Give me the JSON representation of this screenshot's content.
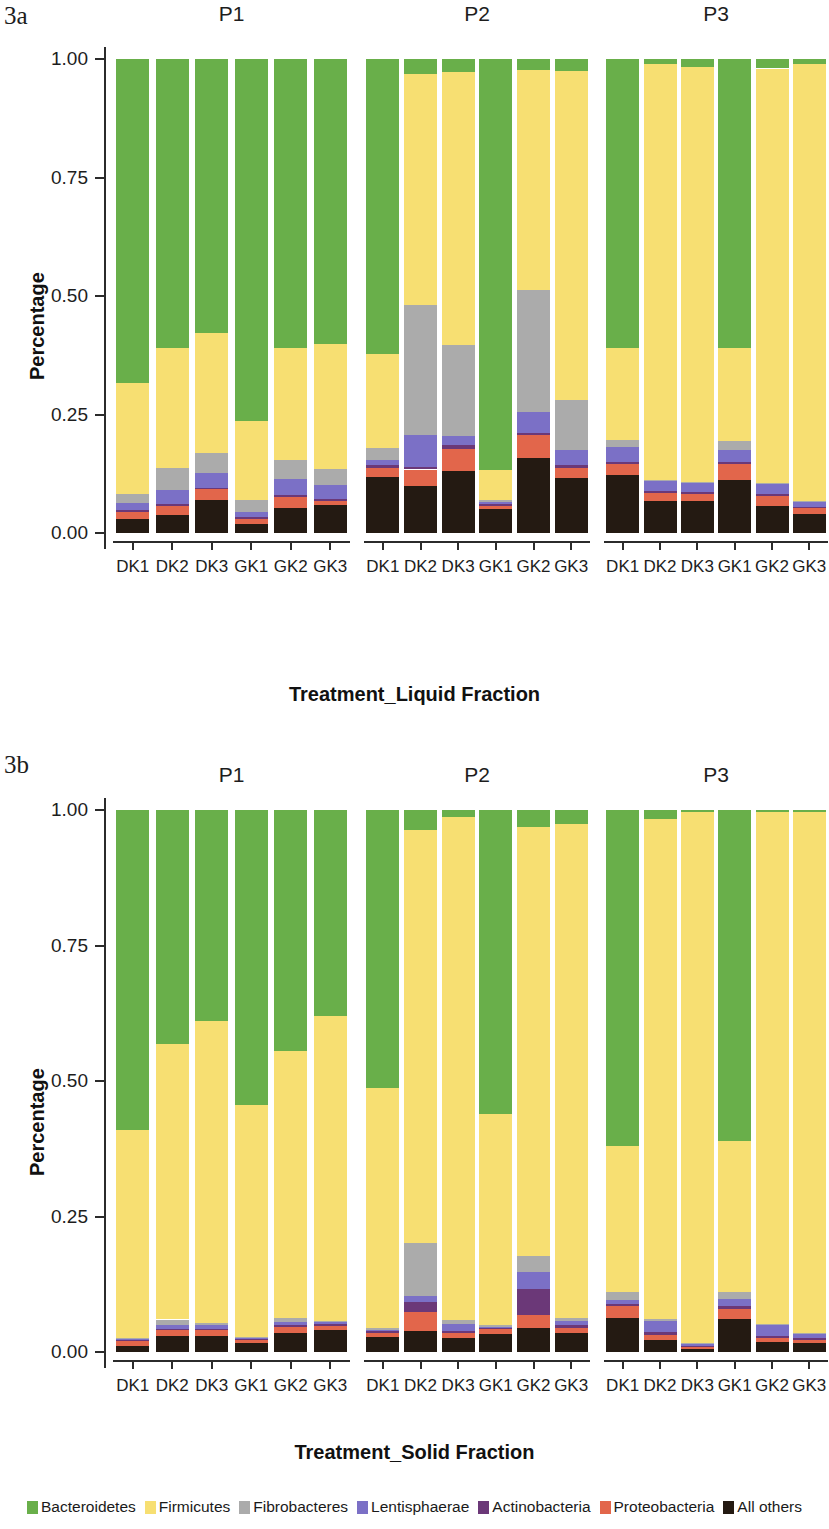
{
  "figure": {
    "panel_a_label": "3a",
    "panel_b_label": "3b"
  },
  "axis": {
    "ylabel": "Percentage",
    "yticks": [
      "0.00",
      "0.25",
      "0.50",
      "0.75",
      "1.00"
    ],
    "ytick_values": [
      0.0,
      0.25,
      0.5,
      0.75,
      1.0
    ],
    "xlabel_a": "Treatment_Liquid Fraction",
    "xlabel_b": "Treatment_Solid Fraction",
    "xticks": [
      "DK1",
      "DK2",
      "DK3",
      "GK1",
      "GK2",
      "GK3"
    ],
    "facets": [
      "P1",
      "P2",
      "P3"
    ]
  },
  "legend": {
    "position": "bottom",
    "items": [
      {
        "label": "Bacteroidetes",
        "color": "#69AF4A"
      },
      {
        "label": "Firmicutes",
        "color": "#F7DF72"
      },
      {
        "label": "Fibrobacteres",
        "color": "#ABABAB"
      },
      {
        "label": "Lentisphaerae",
        "color": "#7B70C6"
      },
      {
        "label": "Actinobacteria",
        "color": "#6B3878"
      },
      {
        "label": "Proteobacteria",
        "color": "#E2664B"
      },
      {
        "label": "All others",
        "color": "#241A12"
      }
    ]
  },
  "chart_data": [
    {
      "id": "3a",
      "type": "bar",
      "stacked": true,
      "title": "3a",
      "xlabel": "Treatment_Liquid Fraction",
      "ylabel": "Percentage",
      "ylim": [
        0,
        1
      ],
      "grid": false,
      "facets": [
        "P1",
        "P2",
        "P3"
      ],
      "categories": [
        "DK1",
        "DK2",
        "DK3",
        "GK1",
        "GK2",
        "GK3"
      ],
      "series_order": [
        "All others",
        "Proteobacteria",
        "Actinobacteria",
        "Lentisphaerae",
        "Fibrobacteres",
        "Firmicutes",
        "Bacteroidetes"
      ],
      "panels": [
        {
          "facet": "P1",
          "bars": [
            {
              "category": "DK1",
              "values": {
                "All others": 0.03,
                "Proteobacteria": 0.014,
                "Actinobacteria": 0.004,
                "Lentisphaerae": 0.016,
                "Fibrobacteres": 0.018,
                "Firmicutes": 0.235,
                "Bacteroidetes": 0.683
              }
            },
            {
              "category": "DK2",
              "values": {
                "All others": 0.038,
                "Proteobacteria": 0.02,
                "Actinobacteria": 0.004,
                "Lentisphaerae": 0.029,
                "Fibrobacteres": 0.046,
                "Firmicutes": 0.253,
                "Bacteroidetes": 0.61
              }
            },
            {
              "category": "DK3",
              "values": {
                "All others": 0.07,
                "Proteobacteria": 0.022,
                "Actinobacteria": 0.004,
                "Lentisphaerae": 0.03,
                "Fibrobacteres": 0.042,
                "Firmicutes": 0.255,
                "Bacteroidetes": 0.577
              }
            },
            {
              "category": "GK1",
              "values": {
                "All others": 0.018,
                "Proteobacteria": 0.012,
                "Actinobacteria": 0.003,
                "Lentisphaerae": 0.012,
                "Fibrobacteres": 0.024,
                "Firmicutes": 0.167,
                "Bacteroidetes": 0.764
              }
            },
            {
              "category": "GK2",
              "values": {
                "All others": 0.053,
                "Proteobacteria": 0.024,
                "Actinobacteria": 0.004,
                "Lentisphaerae": 0.034,
                "Fibrobacteres": 0.04,
                "Firmicutes": 0.235,
                "Bacteroidetes": 0.61
              }
            },
            {
              "category": "GK3",
              "values": {
                "All others": 0.059,
                "Proteobacteria": 0.008,
                "Actinobacteria": 0.004,
                "Lentisphaerae": 0.031,
                "Fibrobacteres": 0.033,
                "Firmicutes": 0.263,
                "Bacteroidetes": 0.602
              }
            }
          ]
        },
        {
          "facet": "P2",
          "bars": [
            {
              "category": "DK1",
              "values": {
                "All others": 0.118,
                "Proteobacteria": 0.02,
                "Actinobacteria": 0.005,
                "Lentisphaerae": 0.012,
                "Fibrobacteres": 0.024,
                "Firmicutes": 0.198,
                "Bacteroidetes": 0.623
              }
            },
            {
              "category": "DK2",
              "values": {
                "All others": 0.1,
                "Proteobacteria": 0.034,
                "Actinobacteria": 0.006,
                "Lentisphaerae": 0.066,
                "Fibrobacteres": 0.274,
                "Firmicutes": 0.488,
                "Bacteroidetes": 0.032
              }
            },
            {
              "category": "DK3",
              "values": {
                "All others": 0.13,
                "Proteobacteria": 0.048,
                "Actinobacteria": 0.008,
                "Lentisphaerae": 0.018,
                "Fibrobacteres": 0.192,
                "Firmicutes": 0.577,
                "Bacteroidetes": 0.027
              }
            },
            {
              "category": "GK1",
              "values": {
                "All others": 0.05,
                "Proteobacteria": 0.008,
                "Actinobacteria": 0.003,
                "Lentisphaerae": 0.005,
                "Fibrobacteres": 0.004,
                "Firmicutes": 0.062,
                "Bacteroidetes": 0.868
              }
            },
            {
              "category": "GK2",
              "values": {
                "All others": 0.158,
                "Proteobacteria": 0.048,
                "Actinobacteria": 0.006,
                "Lentisphaerae": 0.043,
                "Fibrobacteres": 0.257,
                "Firmicutes": 0.464,
                "Bacteroidetes": 0.024
              }
            },
            {
              "category": "GK3",
              "values": {
                "All others": 0.116,
                "Proteobacteria": 0.022,
                "Actinobacteria": 0.005,
                "Lentisphaerae": 0.032,
                "Fibrobacteres": 0.105,
                "Firmicutes": 0.694,
                "Bacteroidetes": 0.026
              }
            }
          ]
        },
        {
          "facet": "P3",
          "bars": [
            {
              "category": "DK1",
              "values": {
                "All others": 0.122,
                "Proteobacteria": 0.024,
                "Actinobacteria": 0.004,
                "Lentisphaerae": 0.032,
                "Fibrobacteres": 0.014,
                "Firmicutes": 0.194,
                "Bacteroidetes": 0.61
              }
            },
            {
              "category": "DK2",
              "values": {
                "All others": 0.068,
                "Proteobacteria": 0.016,
                "Actinobacteria": 0.004,
                "Lentisphaerae": 0.022,
                "Fibrobacteres": 0.002,
                "Firmicutes": 0.878,
                "Bacteroidetes": 0.01
              }
            },
            {
              "category": "DK3",
              "values": {
                "All others": 0.068,
                "Proteobacteria": 0.014,
                "Actinobacteria": 0.004,
                "Lentisphaerae": 0.02,
                "Fibrobacteres": 0.002,
                "Firmicutes": 0.876,
                "Bacteroidetes": 0.016
              }
            },
            {
              "category": "GK1",
              "values": {
                "All others": 0.112,
                "Proteobacteria": 0.034,
                "Actinobacteria": 0.004,
                "Lentisphaerae": 0.026,
                "Fibrobacteres": 0.018,
                "Firmicutes": 0.196,
                "Bacteroidetes": 0.61
              }
            },
            {
              "category": "GK2",
              "values": {
                "All others": 0.058,
                "Proteobacteria": 0.02,
                "Actinobacteria": 0.004,
                "Lentisphaerae": 0.022,
                "Fibrobacteres": 0.002,
                "Firmicutes": 0.874,
                "Bacteroidetes": 0.02
              }
            },
            {
              "category": "GK3",
              "values": {
                "All others": 0.04,
                "Proteobacteria": 0.012,
                "Actinobacteria": 0.003,
                "Lentisphaerae": 0.01,
                "Fibrobacteres": 0.002,
                "Firmicutes": 0.923,
                "Bacteroidetes": 0.01
              }
            }
          ]
        }
      ]
    },
    {
      "id": "3b",
      "type": "bar",
      "stacked": true,
      "title": "3b",
      "xlabel": "Treatment_Solid Fraction",
      "ylabel": "Percentage",
      "ylim": [
        0,
        1
      ],
      "grid": false,
      "facets": [
        "P1",
        "P2",
        "P3"
      ],
      "categories": [
        "DK1",
        "DK2",
        "DK3",
        "GK1",
        "GK2",
        "GK3"
      ],
      "series_order": [
        "All others",
        "Proteobacteria",
        "Actinobacteria",
        "Lentisphaerae",
        "Fibrobacteres",
        "Firmicutes",
        "Bacteroidetes"
      ],
      "panels": [
        {
          "facet": "P1",
          "bars": [
            {
              "category": "DK1",
              "values": {
                "All others": 0.012,
                "Proteobacteria": 0.008,
                "Actinobacteria": 0.002,
                "Lentisphaerae": 0.002,
                "Fibrobacteres": 0.002,
                "Firmicutes": 0.384,
                "Bacteroidetes": 0.59
              }
            },
            {
              "category": "DK2",
              "values": {
                "All others": 0.03,
                "Proteobacteria": 0.01,
                "Actinobacteria": 0.003,
                "Lentisphaerae": 0.007,
                "Fibrobacteres": 0.01,
                "Firmicutes": 0.508,
                "Bacteroidetes": 0.432
              }
            },
            {
              "category": "DK3",
              "values": {
                "All others": 0.03,
                "Proteobacteria": 0.01,
                "Actinobacteria": 0.003,
                "Lentisphaerae": 0.006,
                "Fibrobacteres": 0.005,
                "Firmicutes": 0.556,
                "Bacteroidetes": 0.39
              }
            },
            {
              "category": "GK1",
              "values": {
                "All others": 0.016,
                "Proteobacteria": 0.006,
                "Actinobacteria": 0.002,
                "Lentisphaerae": 0.002,
                "Fibrobacteres": 0.002,
                "Firmicutes": 0.427,
                "Bacteroidetes": 0.545
              }
            },
            {
              "category": "GK2",
              "values": {
                "All others": 0.036,
                "Proteobacteria": 0.01,
                "Actinobacteria": 0.003,
                "Lentisphaerae": 0.006,
                "Fibrobacteres": 0.007,
                "Firmicutes": 0.493,
                "Bacteroidetes": 0.445
              }
            },
            {
              "category": "GK3",
              "values": {
                "All others": 0.04,
                "Proteobacteria": 0.008,
                "Actinobacteria": 0.003,
                "Lentisphaerae": 0.004,
                "Fibrobacteres": 0.003,
                "Firmicutes": 0.562,
                "Bacteroidetes": 0.38
              }
            }
          ]
        },
        {
          "facet": "P2",
          "bars": [
            {
              "category": "DK1",
              "values": {
                "All others": 0.028,
                "Proteobacteria": 0.008,
                "Actinobacteria": 0.002,
                "Lentisphaerae": 0.003,
                "Fibrobacteres": 0.003,
                "Firmicutes": 0.444,
                "Bacteroidetes": 0.512
              }
            },
            {
              "category": "DK2",
              "values": {
                "All others": 0.038,
                "Proteobacteria": 0.036,
                "Actinobacteria": 0.018,
                "Lentisphaerae": 0.012,
                "Fibrobacteres": 0.098,
                "Firmicutes": 0.762,
                "Bacteroidetes": 0.036
              }
            },
            {
              "category": "DK3",
              "values": {
                "All others": 0.026,
                "Proteobacteria": 0.01,
                "Actinobacteria": 0.003,
                "Lentisphaerae": 0.012,
                "Fibrobacteres": 0.008,
                "Firmicutes": 0.929,
                "Bacteroidetes": 0.012
              }
            },
            {
              "category": "GK1",
              "values": {
                "All others": 0.034,
                "Proteobacteria": 0.008,
                "Actinobacteria": 0.002,
                "Lentisphaerae": 0.003,
                "Fibrobacteres": 0.003,
                "Firmicutes": 0.39,
                "Bacteroidetes": 0.56
              }
            },
            {
              "category": "GK2",
              "values": {
                "All others": 0.044,
                "Proteobacteria": 0.024,
                "Actinobacteria": 0.048,
                "Lentisphaerae": 0.032,
                "Fibrobacteres": 0.03,
                "Firmicutes": 0.79,
                "Bacteroidetes": 0.032
              }
            },
            {
              "category": "GK3",
              "values": {
                "All others": 0.036,
                "Proteobacteria": 0.008,
                "Actinobacteria": 0.006,
                "Lentisphaerae": 0.008,
                "Fibrobacteres": 0.004,
                "Firmicutes": 0.912,
                "Bacteroidetes": 0.026
              }
            }
          ]
        },
        {
          "facet": "P3",
          "bars": [
            {
              "category": "DK1",
              "values": {
                "All others": 0.062,
                "Proteobacteria": 0.022,
                "Actinobacteria": 0.004,
                "Lentisphaerae": 0.008,
                "Fibrobacteres": 0.014,
                "Firmicutes": 0.27,
                "Bacteroidetes": 0.62
              }
            },
            {
              "category": "DK2",
              "values": {
                "All others": 0.022,
                "Proteobacteria": 0.01,
                "Actinobacteria": 0.005,
                "Lentisphaerae": 0.02,
                "Fibrobacteres": 0.003,
                "Firmicutes": 0.924,
                "Bacteroidetes": 0.016
              }
            },
            {
              "category": "DK3",
              "values": {
                "All others": 0.006,
                "Proteobacteria": 0.004,
                "Actinobacteria": 0.002,
                "Lentisphaerae": 0.002,
                "Fibrobacteres": 0.002,
                "Firmicutes": 0.98,
                "Bacteroidetes": 0.004
              }
            },
            {
              "category": "GK1",
              "values": {
                "All others": 0.06,
                "Proteobacteria": 0.02,
                "Actinobacteria": 0.004,
                "Lentisphaerae": 0.014,
                "Fibrobacteres": 0.012,
                "Firmicutes": 0.28,
                "Bacteroidetes": 0.61
              }
            },
            {
              "category": "GK2",
              "values": {
                "All others": 0.018,
                "Proteobacteria": 0.008,
                "Actinobacteria": 0.004,
                "Lentisphaerae": 0.02,
                "Fibrobacteres": 0.002,
                "Firmicutes": 0.944,
                "Bacteroidetes": 0.004
              }
            },
            {
              "category": "GK3",
              "values": {
                "All others": 0.016,
                "Proteobacteria": 0.006,
                "Actinobacteria": 0.003,
                "Lentisphaerae": 0.008,
                "Fibrobacteres": 0.002,
                "Firmicutes": 0.961,
                "Bacteroidetes": 0.004
              }
            }
          ]
        }
      ]
    }
  ]
}
